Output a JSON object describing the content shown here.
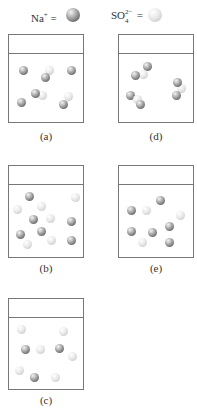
{
  "legend": {
    "na": {
      "text": "Na",
      "charge": "+",
      "equals": "=",
      "color": "#8a8a8a"
    },
    "so4": {
      "text": "SO",
      "subscript": "4",
      "charge": "2−",
      "equals": "=",
      "color": "#e0e0e0"
    }
  },
  "panels": [
    {
      "id": "a",
      "label": "(a)",
      "x": 8,
      "y": 34,
      "w": 76,
      "h": 89,
      "particles": [
        {
          "t": "so4",
          "x": 49,
          "y": 70
        },
        {
          "t": "na",
          "x": 23,
          "y": 70
        },
        {
          "t": "na",
          "x": 45,
          "y": 77
        },
        {
          "t": "na",
          "x": 71,
          "y": 70
        },
        {
          "t": "so4",
          "x": 42,
          "y": 95
        },
        {
          "t": "na",
          "x": 35,
          "y": 93
        },
        {
          "t": "na",
          "x": 21,
          "y": 102
        },
        {
          "t": "so4",
          "x": 68,
          "y": 96
        },
        {
          "t": "na",
          "x": 63,
          "y": 104
        }
      ]
    },
    {
      "id": "d",
      "label": "(d)",
      "x": 118,
      "y": 34,
      "w": 76,
      "h": 89,
      "particles": [
        {
          "t": "na",
          "x": 147,
          "y": 66
        },
        {
          "t": "so4",
          "x": 143,
          "y": 74
        },
        {
          "t": "na",
          "x": 135,
          "y": 75
        },
        {
          "t": "so4",
          "x": 181,
          "y": 88
        },
        {
          "t": "na",
          "x": 177,
          "y": 82
        },
        {
          "t": "na",
          "x": 176,
          "y": 95
        },
        {
          "t": "na",
          "x": 130,
          "y": 95
        },
        {
          "t": "so4",
          "x": 137,
          "y": 99
        },
        {
          "t": "na",
          "x": 140,
          "y": 104
        }
      ]
    },
    {
      "id": "b",
      "label": "(b)",
      "x": 8,
      "y": 165,
      "w": 76,
      "h": 93,
      "particles": [
        {
          "t": "na",
          "x": 29,
          "y": 196
        },
        {
          "t": "so4",
          "x": 75,
          "y": 197
        },
        {
          "t": "so4",
          "x": 41,
          "y": 206
        },
        {
          "t": "so4",
          "x": 17,
          "y": 209
        },
        {
          "t": "na",
          "x": 33,
          "y": 219
        },
        {
          "t": "so4",
          "x": 50,
          "y": 218
        },
        {
          "t": "na",
          "x": 71,
          "y": 221
        },
        {
          "t": "na",
          "x": 41,
          "y": 231
        },
        {
          "t": "na",
          "x": 20,
          "y": 234
        },
        {
          "t": "so4",
          "x": 51,
          "y": 240
        },
        {
          "t": "na",
          "x": 71,
          "y": 240
        },
        {
          "t": "so4",
          "x": 27,
          "y": 244
        }
      ]
    },
    {
      "id": "e",
      "label": "(e)",
      "x": 118,
      "y": 165,
      "w": 76,
      "h": 93,
      "particles": [
        {
          "t": "na",
          "x": 160,
          "y": 200
        },
        {
          "t": "na",
          "x": 131,
          "y": 210
        },
        {
          "t": "so4",
          "x": 146,
          "y": 210
        },
        {
          "t": "so4",
          "x": 180,
          "y": 215
        },
        {
          "t": "na",
          "x": 169,
          "y": 226
        },
        {
          "t": "na",
          "x": 131,
          "y": 231
        },
        {
          "t": "na",
          "x": 152,
          "y": 232
        },
        {
          "t": "so4",
          "x": 142,
          "y": 242
        },
        {
          "t": "na",
          "x": 169,
          "y": 242
        }
      ]
    },
    {
      "id": "c",
      "label": "(c)",
      "x": 8,
      "y": 298,
      "w": 76,
      "h": 92,
      "particles": [
        {
          "t": "so4",
          "x": 21,
          "y": 329
        },
        {
          "t": "so4",
          "x": 63,
          "y": 331
        },
        {
          "t": "na",
          "x": 25,
          "y": 349
        },
        {
          "t": "so4",
          "x": 40,
          "y": 349
        },
        {
          "t": "na",
          "x": 59,
          "y": 348
        },
        {
          "t": "so4",
          "x": 72,
          "y": 356
        },
        {
          "t": "so4",
          "x": 19,
          "y": 370
        },
        {
          "t": "na",
          "x": 34,
          "y": 377
        },
        {
          "t": "so4",
          "x": 55,
          "y": 377
        }
      ]
    }
  ],
  "label_positions": {
    "a": 137,
    "d": 137,
    "b": 269,
    "e": 269,
    "c": 401
  }
}
